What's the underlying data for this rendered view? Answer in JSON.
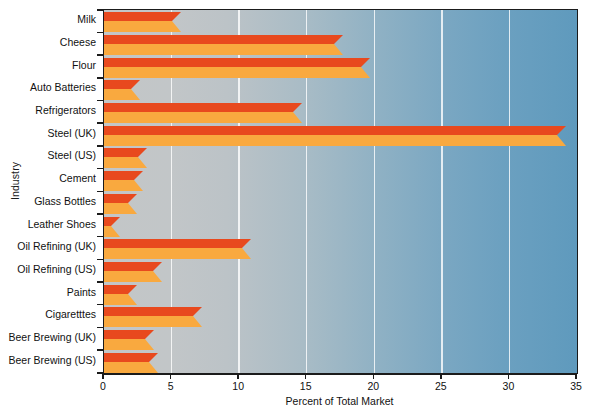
{
  "chart_data": {
    "type": "bar",
    "orientation": "horizontal",
    "title": "",
    "xlabel": "Percent of Total Market",
    "ylabel": "Industry",
    "xlim": [
      0,
      35
    ],
    "xticks": [
      0,
      5,
      10,
      15,
      20,
      25,
      30,
      35
    ],
    "grid": true,
    "legend": null,
    "categories": [
      "Milk",
      "Cheese",
      "Flour",
      "Auto Batteries",
      "Refrigerators",
      "Steel  (UK)",
      "Steel (US)",
      "Cement",
      "Glass Bottles",
      "Leather Shoes",
      "Oil Refining (UK)",
      "Oil Refining (US)",
      "Paints",
      "Cigaretttes",
      "Beer Brewing (UK)",
      "Beer Brewing (US)"
    ],
    "values": [
      5.0,
      17.0,
      19.0,
      2.0,
      14.0,
      33.5,
      2.5,
      2.2,
      1.8,
      0.5,
      10.2,
      3.6,
      1.8,
      6.6,
      3.0,
      3.3
    ],
    "colors": {
      "bar_top": "#e8491e",
      "bar_front": "#f9a93f",
      "plot_background_left": "#c3c6c7",
      "plot_background_right": "#5f9abd",
      "gridline": "#ffffff",
      "axis": "#1b1b1b",
      "text": "#111111"
    }
  }
}
